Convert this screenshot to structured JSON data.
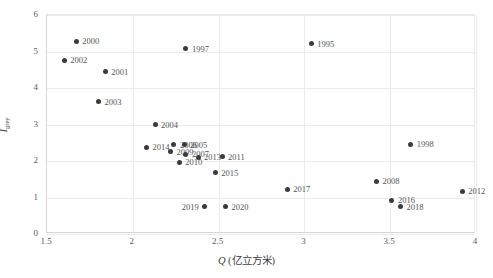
{
  "chart_data": {
    "type": "scatter",
    "title": "",
    "xlabel": "Q (亿立方米)",
    "xlabel_symbol": "Q",
    "xlabel_unit": "(亿立方米)",
    "ylabel": "I grey",
    "ylabel_symbol": "I",
    "ylabel_subscript": "grey",
    "xlim": [
      1.5,
      4.0
    ],
    "ylim": [
      0,
      6
    ],
    "xticks": [
      "1.5",
      "2",
      "2.5",
      "3",
      "3.5",
      "4"
    ],
    "xtick_values": [
      1.5,
      2,
      2.5,
      3,
      3.5,
      4
    ],
    "yticks": [
      "0",
      "1",
      "2",
      "3",
      "4",
      "5",
      "6"
    ],
    "ytick_values": [
      0,
      1,
      2,
      3,
      4,
      5,
      6
    ],
    "grid": true,
    "legend": "none",
    "marker_color": "#3b3b3b",
    "label_color": "#555555",
    "points": [
      {
        "label": "2000",
        "x": 1.67,
        "y": 5.28,
        "side": "r"
      },
      {
        "label": "2002",
        "x": 1.6,
        "y": 4.76,
        "side": "r"
      },
      {
        "label": "2001",
        "x": 1.84,
        "y": 4.44,
        "side": "r"
      },
      {
        "label": "1997",
        "x": 2.31,
        "y": 5.07,
        "side": "r"
      },
      {
        "label": "1995",
        "x": 3.04,
        "y": 5.21,
        "side": "r"
      },
      {
        "label": "2003",
        "x": 1.8,
        "y": 3.63,
        "side": "r"
      },
      {
        "label": "2004",
        "x": 2.13,
        "y": 3.0,
        "side": "r"
      },
      {
        "label": "2014",
        "x": 2.08,
        "y": 2.37,
        "side": "r"
      },
      {
        "label": "2006",
        "x": 2.24,
        "y": 2.45,
        "side": "r"
      },
      {
        "label": "2005",
        "x": 2.3,
        "y": 2.45,
        "side": "r"
      },
      {
        "label": "2009",
        "x": 2.22,
        "y": 2.26,
        "side": "r"
      },
      {
        "label": "2007",
        "x": 2.31,
        "y": 2.18,
        "side": "r"
      },
      {
        "label": "2010",
        "x": 2.27,
        "y": 1.96,
        "side": "r"
      },
      {
        "label": "2013",
        "x": 2.38,
        "y": 2.1,
        "side": "r"
      },
      {
        "label": "2011",
        "x": 2.52,
        "y": 2.12,
        "side": "r"
      },
      {
        "label": "2015",
        "x": 2.48,
        "y": 1.68,
        "side": "r"
      },
      {
        "label": "2017",
        "x": 2.9,
        "y": 1.22,
        "side": "r"
      },
      {
        "label": "2008",
        "x": 3.42,
        "y": 1.44,
        "side": "r"
      },
      {
        "label": "1998",
        "x": 3.62,
        "y": 2.46,
        "side": "r"
      },
      {
        "label": "2012",
        "x": 3.92,
        "y": 1.17,
        "side": "r"
      },
      {
        "label": "2016",
        "x": 3.51,
        "y": 0.92,
        "side": "r"
      },
      {
        "label": "2018",
        "x": 3.56,
        "y": 0.75,
        "side": "r"
      },
      {
        "label": "2019",
        "x": 2.42,
        "y": 0.75,
        "side": "l"
      },
      {
        "label": "2020",
        "x": 2.54,
        "y": 0.75,
        "side": "r"
      }
    ]
  }
}
